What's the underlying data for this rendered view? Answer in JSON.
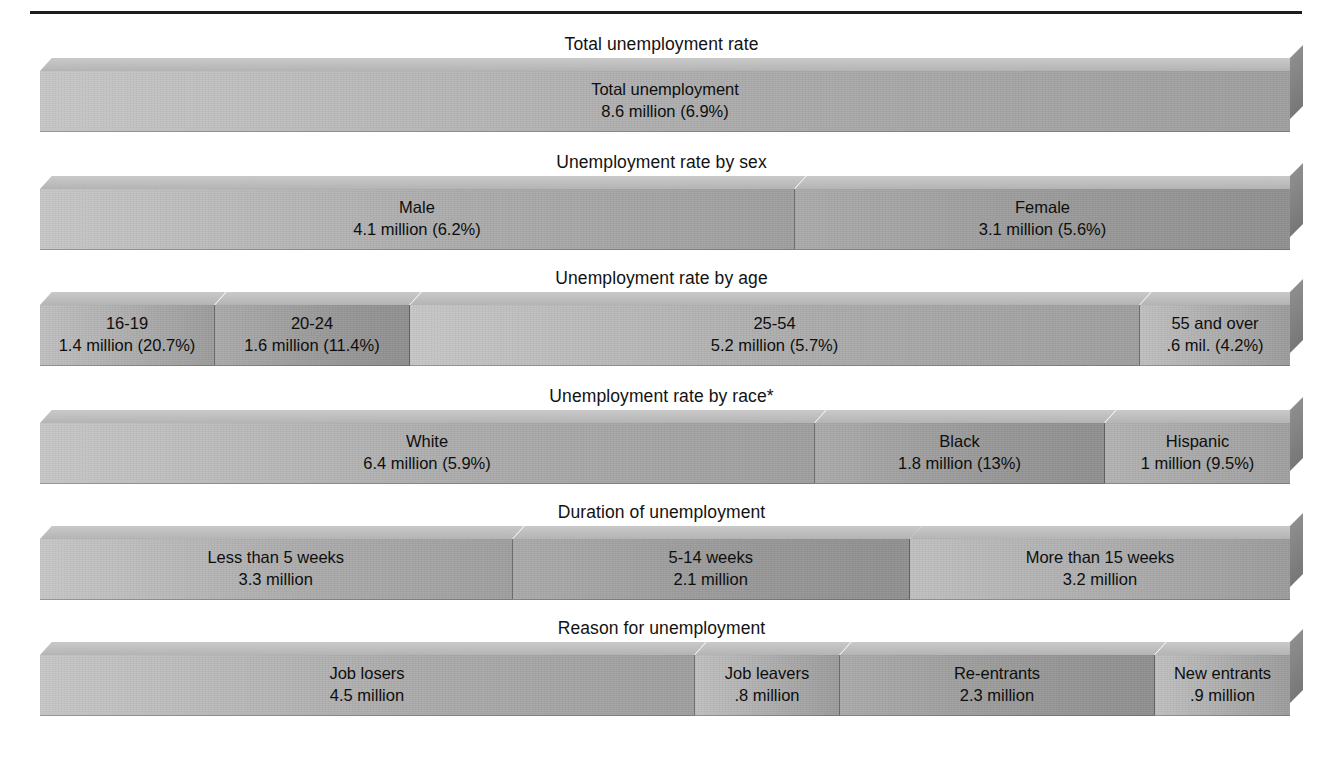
{
  "figure": {
    "title_rule": true,
    "footnote": ""
  },
  "chart_data": {
    "type": "bar",
    "title": "",
    "subtitle": "",
    "xlabel": "",
    "ylabel": "",
    "grid": false,
    "legend": "none",
    "orientation": "horizontal-stacked",
    "unit": "millions of persons",
    "groups": [
      {
        "id": "total",
        "title": "Total unemployment rate",
        "segments": [
          {
            "label": "Total unemployment",
            "value_text": "8.6 million (6.9%)",
            "value": 8.6,
            "rate": 6.9,
            "width_pct": 100.0,
            "shade": "fill-a"
          }
        ]
      },
      {
        "id": "sex",
        "title": "Unemployment rate by sex",
        "segments": [
          {
            "label": "Male",
            "value_text": "4.1 million (6.2%)",
            "value": 4.1,
            "rate": 6.2,
            "width_pct": 60.4,
            "shade": "fill-a"
          },
          {
            "label": "Female",
            "value_text": "3.1 million (5.6%)",
            "value": 3.1,
            "rate": 5.6,
            "width_pct": 39.6,
            "shade": "fill-b"
          }
        ]
      },
      {
        "id": "age",
        "title": "Unemployment rate by age",
        "segments": [
          {
            "label": "16-19",
            "value_text": "1.4 million (20.7%)",
            "value": 1.4,
            "rate": 20.7,
            "width_pct": 14.0,
            "shade": "fill-c"
          },
          {
            "label": "20-24",
            "value_text": "1.6 million (11.4%)",
            "value": 1.6,
            "rate": 11.4,
            "width_pct": 15.6,
            "shade": "fill-b"
          },
          {
            "label": "25-54",
            "value_text": "5.2 million (5.7%)",
            "value": 5.2,
            "rate": 5.7,
            "width_pct": 58.4,
            "shade": "fill-a"
          },
          {
            "label": "55 and over",
            "value_text": ".6 mil. (4.2%)",
            "value": 0.6,
            "rate": 4.2,
            "width_pct": 12.0,
            "shade": "fill-c"
          }
        ]
      },
      {
        "id": "race",
        "title": "Unemployment rate by race*",
        "segments": [
          {
            "label": "White",
            "value_text": "6.4 million (5.9%)",
            "value": 6.4,
            "rate": 5.9,
            "width_pct": 62.0,
            "shade": "fill-a"
          },
          {
            "label": "Black",
            "value_text": "1.8 million (13%)",
            "value": 1.8,
            "rate": 13.0,
            "width_pct": 23.2,
            "shade": "fill-b"
          },
          {
            "label": "Hispanic",
            "value_text": "1 million (9.5%)",
            "value": 1.0,
            "rate": 9.5,
            "width_pct": 14.8,
            "shade": "fill-d"
          }
        ]
      },
      {
        "id": "duration",
        "title": "Duration of unemployment",
        "segments": [
          {
            "label": "Less than 5 weeks",
            "value_text": "3.3 million",
            "value": 3.3,
            "rate": null,
            "width_pct": 37.8,
            "shade": "fill-a"
          },
          {
            "label": "5-14 weeks",
            "value_text": "2.1 million",
            "value": 2.1,
            "rate": null,
            "width_pct": 31.8,
            "shade": "fill-b"
          },
          {
            "label": "More than 15 weeks",
            "value_text": "3.2 million",
            "value": 3.2,
            "rate": null,
            "width_pct": 30.4,
            "shade": "fill-c"
          }
        ]
      },
      {
        "id": "reason",
        "title": "Reason for unemployment",
        "segments": [
          {
            "label": "Job losers",
            "value_text": "4.5 million",
            "value": 4.5,
            "rate": null,
            "width_pct": 52.4,
            "shade": "fill-a"
          },
          {
            "label": "Job leavers",
            "value_text": ".8 million",
            "value": 0.8,
            "rate": null,
            "width_pct": 11.6,
            "shade": "fill-c"
          },
          {
            "label": "Re-entrants",
            "value_text": "2.3 million",
            "value": 2.3,
            "rate": null,
            "width_pct": 25.2,
            "shade": "fill-b"
          },
          {
            "label": "New entrants",
            "value_text": ".9 million",
            "value": 0.9,
            "rate": null,
            "width_pct": 10.8,
            "shade": "fill-c"
          }
        ]
      }
    ]
  }
}
